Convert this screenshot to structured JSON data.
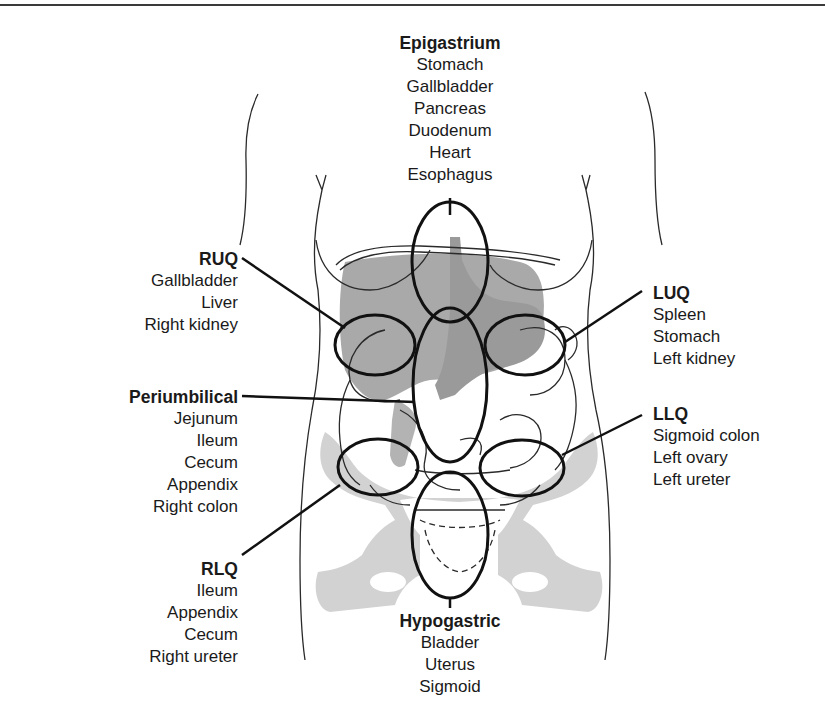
{
  "figure": {
    "type": "anatomical-diagram"
  },
  "regions": {
    "epigastrium": {
      "title": "Epigastrium",
      "organs": [
        "Stomach",
        "Gallbladder",
        "Pancreas",
        "Duodenum",
        "Heart",
        "Esophagus"
      ]
    },
    "ruq": {
      "title": "RUQ",
      "organs": [
        "Gallbladder",
        "Liver",
        "Right kidney"
      ]
    },
    "luq": {
      "title": "LUQ",
      "organs": [
        "Spleen",
        "Stomach",
        "Left kidney"
      ]
    },
    "periumbilical": {
      "title": "Periumbilical",
      "organs": [
        "Jejunum",
        "Ileum",
        "Cecum",
        "Appendix",
        "Right colon"
      ]
    },
    "llq": {
      "title": "LLQ",
      "organs": [
        "Sigmoid colon",
        "Left ovary",
        "Left ureter"
      ]
    },
    "rlq": {
      "title": "RLQ",
      "organs": [
        "Ileum",
        "Appendix",
        "Cecum",
        "Right ureter"
      ]
    },
    "hypogastric": {
      "title": "Hypogastric",
      "organs": [
        "Bladder",
        "Uterus",
        "Sigmoid"
      ]
    }
  },
  "colors": {
    "ink": "#1a1a1a",
    "organ_fill": "#a9a9a9",
    "bone_fill": "#cfcfcf",
    "background": "#ffffff"
  }
}
